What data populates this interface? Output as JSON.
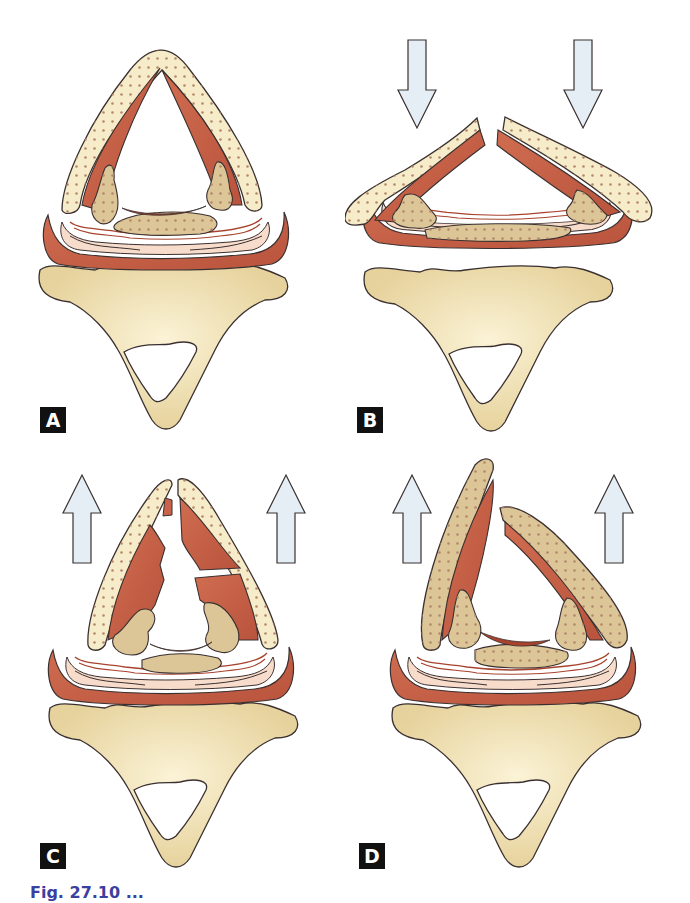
{
  "figure": {
    "panels": [
      {
        "id": "A",
        "label": "A",
        "arrows": "none",
        "state": "intact"
      },
      {
        "id": "B",
        "label": "B",
        "arrows": "down",
        "state": "anterior-fracture-flattened"
      },
      {
        "id": "C",
        "label": "C",
        "arrows": "up",
        "state": "fractured-cartilage-torn-muscle"
      },
      {
        "id": "D",
        "label": "D",
        "arrows": "up",
        "state": "displaced-fragments"
      }
    ],
    "caption": "Fig. 27.10 ..."
  },
  "colors": {
    "cartilage_fill": "#f6ecc9",
    "cartilage_dots": "#b5876a",
    "muscle": "#c9624a",
    "muscle_dark": "#a8432e",
    "arytenoid": "#dcc597",
    "mucosa": "#f8dccb",
    "vertebra": "#efdfaa",
    "arrow_fill": "#e6eef5",
    "outline": "#3a3030",
    "label_bg": "#111111",
    "caption_color": "#3a3fa0"
  }
}
